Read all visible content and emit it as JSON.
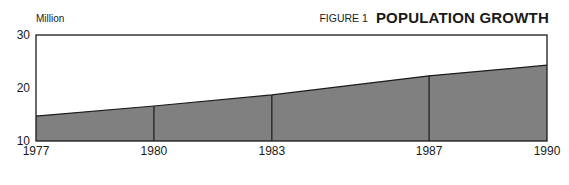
{
  "header": {
    "unit_label": "Million",
    "figure_label": "FIGURE 1",
    "title": "POPULATION GROWTH"
  },
  "colors": {
    "fill": "#808080",
    "line": "#1a1a1a",
    "background": "#ffffff"
  },
  "chart_data": {
    "type": "area",
    "title": "POPULATION GROWTH",
    "subtitle": "FIGURE 1",
    "xlabel": "",
    "ylabel": "Million",
    "x": [
      1977,
      1980,
      1983,
      1987,
      1990
    ],
    "categories": [
      "1977",
      "1980",
      "1983",
      "1987",
      "1990"
    ],
    "series": [
      {
        "name": "Population",
        "values": [
          14.7,
          16.6,
          18.7,
          22.3,
          24.3
        ]
      }
    ],
    "values": [
      14.7,
      16.6,
      18.7,
      22.3,
      24.3
    ],
    "ylim": [
      10,
      30
    ],
    "xlim": [
      1977,
      1990
    ],
    "yticks": [
      10,
      20,
      30
    ],
    "xticks": [
      "1977",
      "1980",
      "1983",
      "1987",
      "1990"
    ],
    "grid": false,
    "legend": "none",
    "vertical_dividers_at": [
      1980,
      1983,
      1987
    ]
  }
}
